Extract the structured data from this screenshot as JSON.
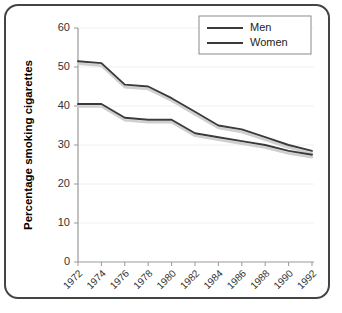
{
  "chart_data": {
    "type": "line",
    "title": "",
    "xlabel": "",
    "ylabel": "Percentage smoking cigarettes",
    "categories": [
      "1972",
      "1974",
      "1976",
      "1978",
      "1980",
      "1982",
      "1984",
      "1986",
      "1988",
      "1990",
      "1992"
    ],
    "x": [
      1972,
      1974,
      1976,
      1978,
      1980,
      1982,
      1984,
      1986,
      1988,
      1990,
      1992
    ],
    "series": [
      {
        "name": "Men",
        "color": "#3a3a3a",
        "values": [
          51.5,
          51.0,
          45.5,
          45.0,
          42.0,
          38.5,
          35.0,
          34.0,
          32.0,
          30.0,
          28.5
        ]
      },
      {
        "name": "Women",
        "color": "#3a3a3a",
        "values": [
          40.5,
          40.5,
          37.0,
          36.5,
          36.5,
          33.0,
          32.0,
          31.0,
          30.0,
          28.5,
          27.5
        ]
      }
    ],
    "ylim": [
      0,
      60
    ],
    "yticks": [
      0,
      10,
      20,
      30,
      40,
      50,
      60
    ],
    "ytick_labels": [
      "0",
      "10",
      "20",
      "30",
      "40",
      "50",
      "60"
    ],
    "grid": true,
    "grid_axis": "y",
    "legend_position": "top-right",
    "legend_entries": [
      "Men",
      "Women"
    ]
  },
  "colors": {
    "line": "#3a3a3a",
    "line_shadow": "#cfcfcf",
    "axis": "#999999",
    "grid": "#f0f0f0",
    "frame_border": "#444444",
    "background": "#ffffff",
    "text": "#333333"
  }
}
